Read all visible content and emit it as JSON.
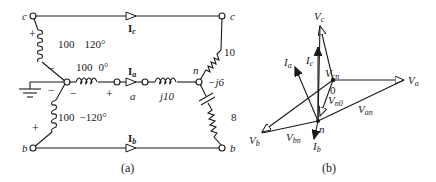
{
  "figure_a": {
    "caption": "(a)",
    "nodes": {
      "c_left": "c",
      "b_left": "b",
      "c_right": "c",
      "b_right": "b",
      "a": "a",
      "n": "n"
    },
    "sources": [
      {
        "name": "source-c",
        "magnitude": "100",
        "angle": "120°"
      },
      {
        "name": "source-a",
        "magnitude": "100",
        "angle": "0°"
      },
      {
        "name": "source-b",
        "magnitude": "100",
        "angle": "−120°"
      }
    ],
    "currents": {
      "Ic": "I",
      "Ic_sub": "c",
      "Ia": "I",
      "Ia_sub": "a",
      "Ib": "I",
      "Ib_sub": "b"
    },
    "impedances": {
      "line_a": "j10",
      "phase_c": "10",
      "phase_b_cap": "−j6",
      "phase_b_res": "8"
    },
    "polarity": {
      "plus": "+",
      "minus": "−"
    }
  },
  "figure_b": {
    "caption": "(b)",
    "labels": {
      "Vc": "V",
      "Vc_sub": "c",
      "Va": "V",
      "Va_sub": "a",
      "Vb": "V",
      "Vb_sub": "b",
      "Ic": "I",
      "Ic_sub": "c",
      "Ia": "I",
      "Ia_sub": "a",
      "Ib": "I",
      "Ib_sub": "b",
      "Vcn": "V",
      "Vcn_sub": "cn",
      "Vn0": "V",
      "Vn0_sub": "n0",
      "Van": "V",
      "Van_sub": "an",
      "Vbn": "V",
      "Vbn_sub": "bn",
      "origin": "0",
      "neutral": "n"
    }
  }
}
